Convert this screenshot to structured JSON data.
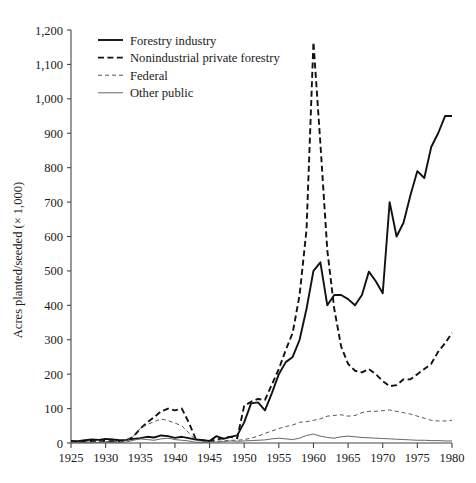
{
  "chart_data": {
    "type": "line",
    "title": "",
    "xlabel": "",
    "ylabel": "Acres planted/seeded (× 1,000)",
    "xlim": [
      1925,
      1980
    ],
    "ylim": [
      0,
      1200
    ],
    "grid": false,
    "legend_position": "top-left",
    "xticks": [
      "1925",
      "1930",
      "1935",
      "1940",
      "1945",
      "1950",
      "1955",
      "1960",
      "1965",
      "1970",
      "1975",
      "1980"
    ],
    "yticks": [
      "0",
      "100",
      "200",
      "300",
      "400",
      "500",
      "600",
      "700",
      "800",
      "900",
      "1,000",
      "1,100",
      "1,200"
    ],
    "x": [
      1925,
      1926,
      1927,
      1928,
      1929,
      1930,
      1931,
      1932,
      1933,
      1934,
      1935,
      1936,
      1937,
      1938,
      1939,
      1940,
      1941,
      1942,
      1943,
      1944,
      1945,
      1946,
      1947,
      1948,
      1949,
      1950,
      1951,
      1952,
      1953,
      1954,
      1955,
      1956,
      1957,
      1958,
      1959,
      1960,
      1961,
      1962,
      1963,
      1964,
      1965,
      1966,
      1967,
      1968,
      1969,
      1970,
      1971,
      1972,
      1973,
      1974,
      1975,
      1976,
      1977,
      1978,
      1979,
      1980
    ],
    "series": [
      {
        "name": "Forestry industry",
        "style": "solid",
        "color": "#111111",
        "values": [
          6,
          5,
          8,
          10,
          9,
          12,
          10,
          8,
          9,
          12,
          14,
          18,
          16,
          22,
          20,
          15,
          18,
          14,
          10,
          8,
          6,
          20,
          12,
          18,
          22,
          60,
          115,
          118,
          95,
          145,
          200,
          235,
          250,
          300,
          390,
          500,
          525,
          400,
          430,
          430,
          418,
          400,
          430,
          498,
          470,
          435,
          700,
          600,
          640,
          720,
          790,
          770,
          860,
          900,
          950,
          950
        ]
      },
      {
        "name": "Nonindustrial private forestry",
        "style": "dashed",
        "color": "#111111",
        "values": [
          4,
          3,
          5,
          6,
          5,
          6,
          5,
          4,
          8,
          18,
          42,
          60,
          75,
          92,
          100,
          95,
          100,
          60,
          12,
          8,
          6,
          10,
          14,
          18,
          14,
          108,
          120,
          128,
          125,
          170,
          215,
          270,
          320,
          430,
          620,
          1165,
          870,
          560,
          390,
          280,
          230,
          210,
          205,
          215,
          200,
          180,
          165,
          168,
          185,
          185,
          200,
          215,
          230,
          265,
          290,
          320
        ]
      },
      {
        "name": "Federal",
        "style": "dashed-light",
        "color": "#555555",
        "values": [
          2,
          2,
          3,
          3,
          4,
          4,
          4,
          4,
          6,
          20,
          42,
          54,
          62,
          70,
          65,
          58,
          50,
          30,
          8,
          5,
          4,
          5,
          6,
          8,
          8,
          10,
          14,
          20,
          28,
          35,
          42,
          48,
          52,
          60,
          62,
          66,
          70,
          78,
          80,
          82,
          78,
          80,
          88,
          92,
          92,
          94,
          96,
          92,
          88,
          84,
          78,
          72,
          66,
          64,
          64,
          66
        ]
      },
      {
        "name": "Other public",
        "style": "solid-light",
        "color": "#666666",
        "values": [
          1,
          1,
          1,
          1,
          2,
          2,
          2,
          2,
          3,
          8,
          12,
          10,
          8,
          12,
          14,
          10,
          8,
          6,
          2,
          2,
          2,
          3,
          4,
          6,
          5,
          6,
          7,
          8,
          9,
          12,
          14,
          12,
          10,
          14,
          22,
          26,
          20,
          16,
          14,
          18,
          20,
          18,
          16,
          15,
          14,
          13,
          12,
          11,
          10,
          9,
          8,
          8,
          7,
          7,
          6,
          6
        ]
      }
    ]
  },
  "legend": {
    "items": [
      {
        "label": "Forestry industry",
        "style": "solid"
      },
      {
        "label": "Nonindustrial private forestry",
        "style": "dashed"
      },
      {
        "label": "Federal",
        "style": "dashed-light"
      },
      {
        "label": "Other public",
        "style": "solid-light"
      }
    ]
  }
}
